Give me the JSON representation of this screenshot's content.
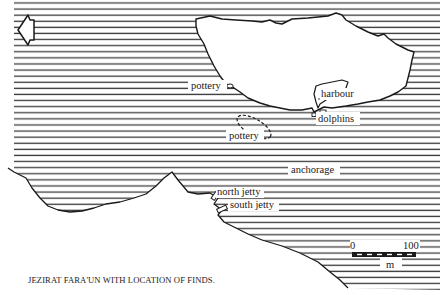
{
  "title": "JEZIRAT FARA'UN WITH LOCATION OF FINDS.",
  "colors": {
    "ink": "#1a1a1a",
    "sea_hatch": "#333333",
    "paper": "#ffffff"
  },
  "north_arrow": {
    "icon": "north-arrow-icon",
    "direction": "left"
  },
  "labels": {
    "pottery_shore": "pottery",
    "harbour": "harbour",
    "dolphins": "dolphins",
    "pottery_offshore": "pottery",
    "anchorage": "anchorage",
    "north_jetty": "north jetty",
    "south_jetty": "south jetty"
  },
  "scale_bar": {
    "start": "0",
    "end": "100",
    "unit": "m"
  }
}
